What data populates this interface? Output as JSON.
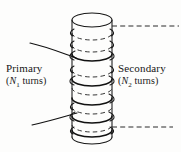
{
  "figure": {
    "kind": "transformer-winding-diagram",
    "background_color": "#fdfdfc",
    "ink_color": "#161616",
    "width": 181,
    "height": 152
  },
  "labels": {
    "primary": {
      "title": "Primary",
      "turns_open": "(",
      "turns_symbol": "N",
      "turns_subscript": "1",
      "turns_word": " turns",
      "turns_close": ")"
    },
    "secondary": {
      "title": "Secondary",
      "turns_open": "(",
      "turns_symbol": "N",
      "turns_subscript": "2",
      "turns_word": " turns",
      "turns_close": ")"
    }
  },
  "core": {
    "name": "cylindrical-core",
    "left_x": 72,
    "right_x": 112,
    "top_y": 20,
    "bottom_y": 137,
    "ellipse_ry": 7
  },
  "windings": {
    "primary_style": "solid",
    "secondary_style": "dashed",
    "primary_band_y": [
      60,
      79,
      98,
      117,
      129
    ],
    "secondary_band_y": [
      33,
      45,
      70,
      88,
      107,
      125
    ],
    "front_arc_count": 5,
    "back_arc_count": 6
  },
  "leads": {
    "primary_upper": {
      "x1": 30,
      "y1": 43,
      "x2": 74,
      "y2": 57
    },
    "primary_lower": {
      "x1": 32,
      "y1": 124,
      "x2": 76,
      "y2": 114
    },
    "secondary_upper": {
      "x1": 112,
      "y1": 26,
      "x2": 178,
      "y2": 26
    },
    "secondary_lower": {
      "x1": 112,
      "y1": 127,
      "x2": 172,
      "y2": 127
    }
  }
}
